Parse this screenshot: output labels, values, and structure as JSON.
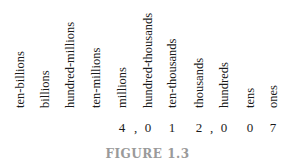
{
  "figure": {
    "caption": "FIGURE 1.3",
    "place_values": [
      {
        "label": "ten-billions",
        "digit": ""
      },
      {
        "label": "billions",
        "digit": ""
      },
      {
        "label": "hundred-millions",
        "digit": ""
      },
      {
        "label": "ten-millions",
        "digit": ""
      },
      {
        "label": "millions",
        "digit": "4"
      },
      {
        "label": "hundred-thousands",
        "digit": "0"
      },
      {
        "label": "ten-thousands",
        "digit": "1"
      },
      {
        "label": "thousands",
        "digit": "2"
      },
      {
        "label": "hundreds",
        "digit": "0"
      },
      {
        "label": "tens",
        "digit": "0"
      },
      {
        "label": "ones",
        "digit": "7"
      }
    ],
    "separator": ",",
    "number_shown": "4,012,007"
  }
}
